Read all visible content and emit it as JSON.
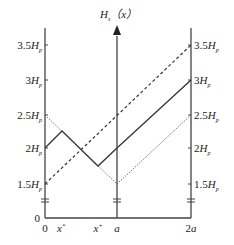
{
  "diagram": {
    "title_main": "H",
    "title_sub": "s",
    "title_arg": "（x）",
    "y_labels_left": [
      {
        "coef": "3.5",
        "unit": "H",
        "sub": "p"
      },
      {
        "coef": "3",
        "unit": "H",
        "sub": "p"
      },
      {
        "coef": "2.5",
        "unit": "H",
        "sub": "p"
      },
      {
        "coef": "2",
        "unit": "H",
        "sub": "p"
      },
      {
        "coef": "1.5",
        "unit": "H",
        "sub": "p"
      }
    ],
    "y_labels_right": [
      {
        "coef": "3.5",
        "unit": "H",
        "sub": "p"
      },
      {
        "coef": "3",
        "unit": "H",
        "sub": "p"
      },
      {
        "coef": "2.5",
        "unit": "H",
        "sub": "p"
      },
      {
        "coef": "2",
        "unit": "H",
        "sub": "p"
      },
      {
        "coef": "1.5",
        "unit": "H",
        "sub": "p"
      }
    ],
    "y_zero": "0",
    "x_labels": {
      "zero": "0",
      "x_minus_base": "x",
      "x_minus_sup": "*",
      "x_plus_base": "x",
      "x_plus_sup": "+",
      "a": "a",
      "two_a": "2a"
    },
    "series": [
      {
        "name": "solid",
        "style": "solid",
        "points_x_over_a": [
          0,
          0.23,
          0.74,
          1,
          2
        ],
        "points_H_over_Hp": [
          2,
          2.25,
          1.75,
          2,
          3
        ]
      },
      {
        "name": "dashed",
        "style": "dashed",
        "points_x_over_a": [
          0,
          2
        ],
        "points_H_over_Hp": [
          1.5,
          3.5
        ]
      },
      {
        "name": "dotted",
        "style": "dotted",
        "points_x_over_a": [
          0,
          1,
          2
        ],
        "points_H_over_Hp": [
          2.5,
          1.5,
          2.5
        ]
      }
    ],
    "colors": {
      "line": "#333333",
      "axis": "#444444"
    }
  }
}
